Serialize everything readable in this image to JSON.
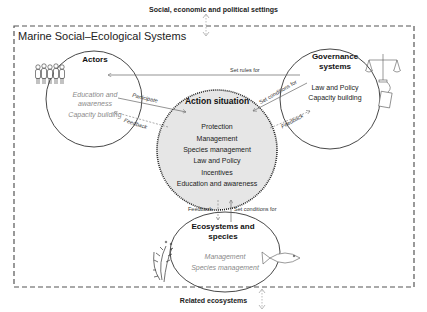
{
  "outer": {
    "top_label": "Social, economic and political settings",
    "bottom_label": "Related ecosystems",
    "system_title": "Marine Social–Ecological Systems"
  },
  "nodes": {
    "actors": {
      "title": "Actors",
      "items": [
        "Education and",
        "awareness",
        "Capacity building"
      ],
      "icon": "people-icon"
    },
    "governance": {
      "title_line1": "Governance",
      "title_line2": "systems",
      "items": [
        "Law and Policy",
        "Capacity building"
      ],
      "icons": [
        "scales-icon",
        "document-icon"
      ]
    },
    "action": {
      "title": "Action situation",
      "items": [
        "Protection",
        "Management",
        "Species management",
        "Law and Policy",
        "Incentives",
        "Education and awareness"
      ]
    },
    "ecosystems": {
      "title_line1": "Ecosystems and",
      "title_line2": "species",
      "items": [
        "Management",
        "Species management"
      ],
      "icons": [
        "seaweed-icon",
        "fish-icon"
      ]
    }
  },
  "edges": {
    "set_rules_for": "Set rules for",
    "participate": "Participate",
    "feedback_actors": "Feedback",
    "set_conditions_gov": "Set conditions for",
    "feedback_gov": "Feedback",
    "feedback_eco": "Feedback",
    "set_conditions_eco": "Set conditions for"
  },
  "colors": {
    "action_fill": "#e6e6e6",
    "line": "#555555",
    "gray_text": "#8a8a8a"
  }
}
